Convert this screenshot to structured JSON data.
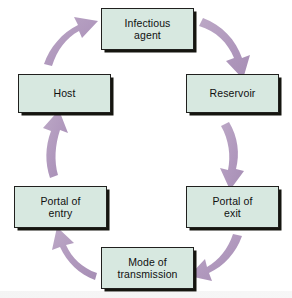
{
  "diagram": {
    "type": "cycle",
    "direction": "clockwise",
    "node_count": 6,
    "arrow_count": 6,
    "colors": {
      "node_fill": "#d7e8e0",
      "node_border": "#20201e",
      "node_shadow": "#15150f",
      "arrow": "#b49cc0",
      "arrow_shade": "#a98fb8",
      "background": "#ffffff",
      "text": "#101010"
    },
    "nodes": [
      {
        "id": "infectious-agent",
        "label": "Infectious\nagent",
        "position": "top"
      },
      {
        "id": "reservoir",
        "label": "Reservoir",
        "position": "upper-right"
      },
      {
        "id": "portal-of-exit",
        "label": "Portal of\nexit",
        "position": "lower-right"
      },
      {
        "id": "mode-transmission",
        "label": "Mode of\ntransmission",
        "position": "bottom"
      },
      {
        "id": "portal-of-entry",
        "label": "Portal of\nentry",
        "position": "lower-left"
      },
      {
        "id": "host",
        "label": "Host",
        "position": "upper-left"
      }
    ],
    "arrows": [
      {
        "id": "arrow-agent-to-reservoir",
        "from": "infectious-agent",
        "to": "reservoir",
        "direction": "down-right"
      },
      {
        "id": "arrow-reservoir-to-portal-exit",
        "from": "reservoir",
        "to": "portal-of-exit",
        "direction": "down"
      },
      {
        "id": "arrow-portal-exit-to-mode",
        "from": "portal-of-exit",
        "to": "mode-transmission",
        "direction": "down-left"
      },
      {
        "id": "arrow-mode-to-portal-entry",
        "from": "mode-transmission",
        "to": "portal-of-entry",
        "direction": "up-left"
      },
      {
        "id": "arrow-portal-entry-to-host",
        "from": "portal-of-entry",
        "to": "host",
        "direction": "up"
      },
      {
        "id": "arrow-host-to-agent",
        "from": "host",
        "to": "infectious-agent",
        "direction": "up-right"
      }
    ]
  }
}
